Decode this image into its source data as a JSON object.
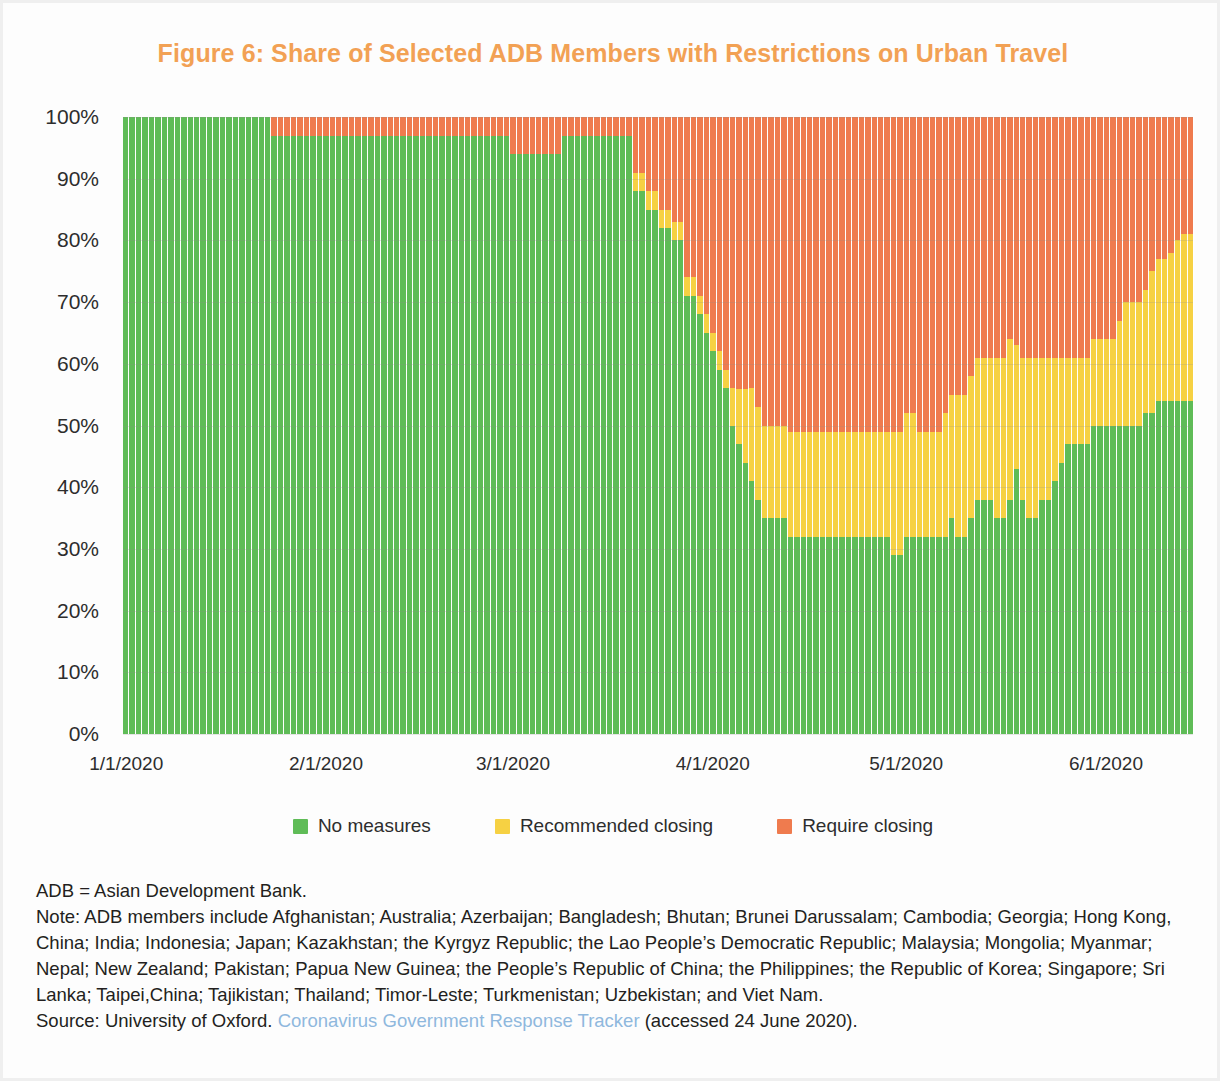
{
  "figure": {
    "title": "Figure 6: Share of Selected ADB Members with Restrictions on Urban Travel",
    "title_color": "#f2a154"
  },
  "legend": {
    "position": "bottom-center",
    "items": [
      {
        "label": "No measures",
        "color": "#5fbc57",
        "key": "no_measures"
      },
      {
        "label": "Recommended closing",
        "color": "#f6d143",
        "key": "recommended_closing"
      },
      {
        "label": "Require closing",
        "color": "#ef7b4e",
        "key": "require_closing"
      }
    ]
  },
  "axes": {
    "y_ticks": [
      "0%",
      "10%",
      "20%",
      "30%",
      "40%",
      "50%",
      "60%",
      "70%",
      "80%",
      "90%",
      "100%"
    ],
    "x_ticks": [
      "1/1/2020",
      "2/1/2020",
      "3/1/2020",
      "4/1/2020",
      "5/1/2020",
      "6/1/2020"
    ]
  },
  "footnotes": {
    "abbrev": "ADB = Asian Development Bank.",
    "note": "Note: ADB members include Afghanistan; Australia; Azerbaijan; Bangladesh; Bhutan; Brunei Darussalam; Cambodia; Georgia; Hong Kong, China; India; Indonesia; Japan; Kazakhstan; the Kyrgyz Republic; the Lao People’s Democratic Republic; Malaysia; Mongolia; Myanmar; Nepal; New Zealand; Pakistan; Papua New Guinea; the People’s Republic of China; the Philippines; the Republic of Korea; Singapore; Sri Lanka; Taipei,China; Tajikistan; Thailand; Timor-Leste; Turkmenistan; Uzbekistan; and Viet Nam.",
    "source_prefix": "Source: University of Oxford. ",
    "source_link": "Coronavirus Government Response Tracker",
    "source_suffix": " (accessed 24 June 2020)."
  },
  "chart_data": {
    "type": "bar",
    "stacked": true,
    "normalized_percent": true,
    "title": "Figure 6: Share of Selected ADB Members with Restrictions on Urban Travel",
    "xlabel": "",
    "ylabel": "",
    "ylim": [
      0,
      100
    ],
    "grid": true,
    "legend_position": "bottom-center",
    "x_start_date": "2020-01-01",
    "x_end_date": "2020-06-13",
    "x_tick_labels": [
      "1/1/2020",
      "2/1/2020",
      "3/1/2020",
      "4/1/2020",
      "5/1/2020",
      "6/1/2020"
    ],
    "x_tick_indices": [
      0,
      31,
      60,
      91,
      121,
      152
    ],
    "y_tick_labels": [
      "0%",
      "10%",
      "20%",
      "30%",
      "40%",
      "50%",
      "60%",
      "70%",
      "80%",
      "90%",
      "100%"
    ],
    "series": [
      {
        "name": "No measures",
        "color": "#5fbc57",
        "values": [
          100,
          100,
          100,
          100,
          100,
          100,
          100,
          100,
          100,
          100,
          100,
          100,
          100,
          100,
          100,
          100,
          100,
          100,
          100,
          100,
          100,
          100,
          100,
          97,
          97,
          97,
          97,
          97,
          97,
          97,
          97,
          97,
          97,
          97,
          97,
          97,
          97,
          97,
          97,
          97,
          97,
          97,
          97,
          97,
          97,
          97,
          97,
          97,
          97,
          97,
          97,
          97,
          97,
          97,
          97,
          97,
          97,
          97,
          97,
          97,
          94,
          94,
          94,
          94,
          94,
          94,
          94,
          94,
          97,
          97,
          97,
          97,
          97,
          97,
          97,
          97,
          97,
          97,
          97,
          88,
          88,
          85,
          85,
          82,
          82,
          80,
          80,
          71,
          71,
          68,
          65,
          62,
          59,
          56,
          50,
          47,
          44,
          41,
          38,
          35,
          35,
          35,
          35,
          32,
          32,
          32,
          32,
          32,
          32,
          32,
          32,
          32,
          32,
          32,
          32,
          32,
          32,
          32,
          32,
          29,
          29,
          32,
          32,
          32,
          32,
          32,
          32,
          32,
          35,
          32,
          32,
          35,
          38,
          38,
          38,
          35,
          35,
          38,
          43,
          38,
          35,
          35,
          38,
          38,
          41,
          44,
          47,
          47,
          47,
          47,
          50,
          50,
          50,
          50,
          50,
          50,
          50,
          50,
          52,
          52,
          54,
          54,
          54,
          54,
          54,
          54
        ]
      },
      {
        "name": "Recommended closing",
        "color": "#f6d143",
        "values": [
          0,
          0,
          0,
          0,
          0,
          0,
          0,
          0,
          0,
          0,
          0,
          0,
          0,
          0,
          0,
          0,
          0,
          0,
          0,
          0,
          0,
          0,
          0,
          0,
          0,
          0,
          0,
          0,
          0,
          0,
          0,
          0,
          0,
          0,
          0,
          0,
          0,
          0,
          0,
          0,
          0,
          0,
          0,
          0,
          0,
          0,
          0,
          0,
          0,
          0,
          0,
          0,
          0,
          0,
          0,
          0,
          0,
          0,
          0,
          0,
          0,
          0,
          0,
          0,
          0,
          0,
          0,
          0,
          0,
          0,
          0,
          0,
          0,
          0,
          0,
          0,
          0,
          0,
          0,
          3,
          3,
          3,
          3,
          3,
          3,
          3,
          3,
          3,
          3,
          3,
          3,
          3,
          3,
          3,
          6,
          9,
          12,
          15,
          15,
          15,
          15,
          15,
          15,
          17,
          17,
          17,
          17,
          17,
          17,
          17,
          17,
          17,
          17,
          17,
          17,
          17,
          17,
          17,
          17,
          20,
          20,
          20,
          20,
          17,
          17,
          17,
          17,
          20,
          20,
          23,
          23,
          23,
          23,
          23,
          23,
          26,
          26,
          26,
          20,
          23,
          26,
          26,
          23,
          23,
          20,
          17,
          14,
          14,
          14,
          14,
          14,
          14,
          14,
          14,
          17,
          20,
          20,
          20,
          20,
          23,
          23,
          23,
          24,
          26,
          27,
          27
        ]
      },
      {
        "name": "Require closing",
        "color": "#ef7b4e",
        "values": [
          0,
          0,
          0,
          0,
          0,
          0,
          0,
          0,
          0,
          0,
          0,
          0,
          0,
          0,
          0,
          0,
          0,
          0,
          0,
          0,
          0,
          0,
          0,
          3,
          3,
          3,
          3,
          3,
          3,
          3,
          3,
          3,
          3,
          3,
          3,
          3,
          3,
          3,
          3,
          3,
          3,
          3,
          3,
          3,
          3,
          3,
          3,
          3,
          3,
          3,
          3,
          3,
          3,
          3,
          3,
          3,
          3,
          3,
          3,
          3,
          6,
          6,
          6,
          6,
          6,
          6,
          6,
          6,
          3,
          3,
          3,
          3,
          3,
          3,
          3,
          3,
          3,
          3,
          3,
          9,
          9,
          12,
          12,
          15,
          15,
          17,
          17,
          26,
          26,
          29,
          32,
          35,
          38,
          41,
          44,
          44,
          44,
          44,
          47,
          50,
          50,
          50,
          50,
          51,
          51,
          51,
          51,
          51,
          51,
          51,
          51,
          51,
          51,
          51,
          51,
          51,
          51,
          51,
          51,
          51,
          51,
          48,
          48,
          51,
          51,
          51,
          51,
          48,
          45,
          45,
          45,
          42,
          39,
          39,
          39,
          39,
          39,
          36,
          37,
          39,
          39,
          39,
          39,
          39,
          39,
          39,
          39,
          39,
          39,
          39,
          36,
          36,
          36,
          36,
          33,
          30,
          30,
          30,
          28,
          25,
          23,
          23,
          22,
          20,
          19,
          19
        ]
      }
    ]
  }
}
